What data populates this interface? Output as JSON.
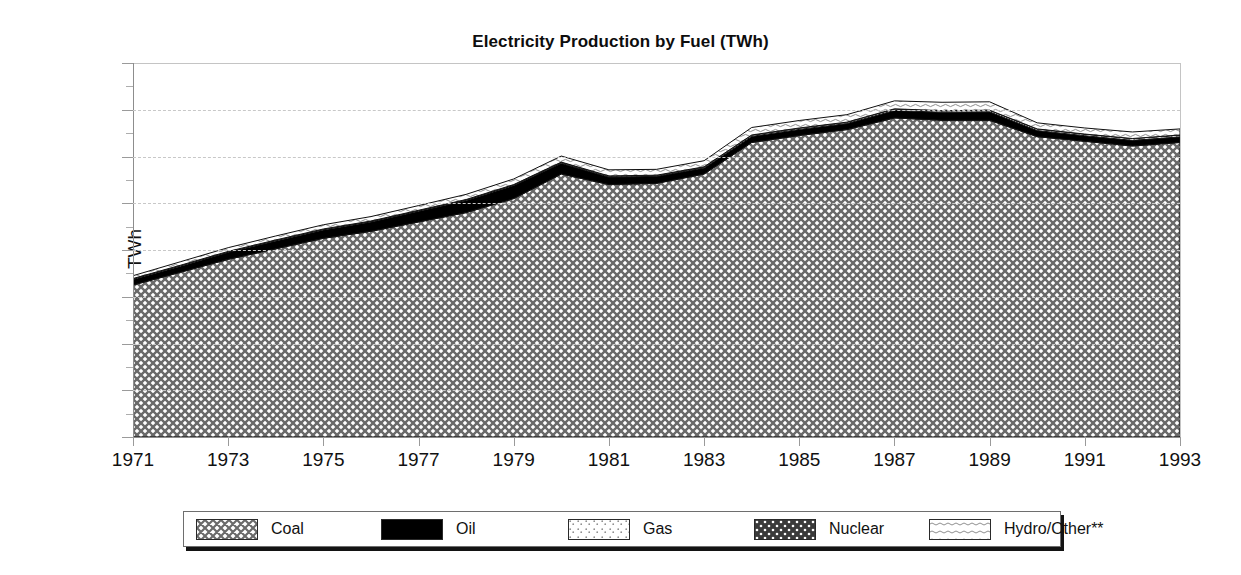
{
  "chart_data": {
    "type": "area",
    "stacked": true,
    "title": "Electricity Production by Fuel (TWh)",
    "xlabel": "",
    "ylabel": "TWh",
    "ylim": [
      0,
      160
    ],
    "xlim": [
      1971,
      1993
    ],
    "y_ticks": [
      0,
      20,
      40,
      60,
      80,
      100,
      120,
      140,
      160
    ],
    "y_minor_ticks": [
      10,
      30,
      50,
      70,
      90,
      110,
      130,
      150
    ],
    "x_ticks": [
      1971,
      1973,
      1975,
      1977,
      1979,
      1981,
      1983,
      1985,
      1987,
      1989,
      1991,
      1993
    ],
    "grid": "horizontal-dashed",
    "legend_position": "bottom",
    "x": [
      1971,
      1972,
      1973,
      1974,
      1975,
      1976,
      1977,
      1978,
      1979,
      1980,
      1981,
      1982,
      1983,
      1984,
      1985,
      1986,
      1987,
      1988,
      1989,
      1990,
      1991,
      1992,
      1993
    ],
    "series": [
      {
        "name": "Coal",
        "pattern": "diagonal-crosshatch",
        "color": "#d6d6d6",
        "values": [
          65.0,
          70.5,
          76.0,
          80.5,
          85.0,
          88.0,
          92.0,
          96.0,
          102.0,
          112.5,
          108.0,
          108.5,
          112.5,
          126.0,
          129.0,
          131.5,
          136.5,
          135.5,
          135.5,
          128.5,
          126.5,
          124.5,
          126.0
        ]
      },
      {
        "name": "Oil",
        "pattern": "solid-black",
        "color": "#000000",
        "values": [
          2.4,
          2.6,
          3.0,
          3.4,
          3.6,
          4.0,
          4.6,
          5.2,
          5.6,
          4.6,
          3.2,
          3.0,
          2.6,
          2.6,
          2.6,
          2.6,
          3.2,
          3.4,
          3.6,
          2.6,
          2.4,
          2.4,
          2.4
        ]
      },
      {
        "name": "Gas",
        "pattern": "light-dots",
        "color": "#efefef",
        "values": [
          0.4,
          0.4,
          0.4,
          0.4,
          0.4,
          0.4,
          0.4,
          0.4,
          0.4,
          0.5,
          0.5,
          0.5,
          0.5,
          0.6,
          0.6,
          0.6,
          0.7,
          0.7,
          0.7,
          0.7,
          0.7,
          0.8,
          0.8
        ]
      },
      {
        "name": "Nuclear",
        "pattern": "dense-dark-dots",
        "color": "#575757",
        "values": [
          0.0,
          0.0,
          0.0,
          0.0,
          0.0,
          0.0,
          0.0,
          0.0,
          0.0,
          0.0,
          0.0,
          0.0,
          0.0,
          0.0,
          0.0,
          0.0,
          0.0,
          0.0,
          0.0,
          0.0,
          0.0,
          0.0,
          0.0
        ]
      },
      {
        "name": "Hydro/Other**",
        "pattern": "light-waves",
        "color": "#ececec",
        "values": [
          1.2,
          1.5,
          1.6,
          1.7,
          1.8,
          1.9,
          2.0,
          2.2,
          2.4,
          2.6,
          2.6,
          2.5,
          2.6,
          3.2,
          3.2,
          3.2,
          3.4,
          3.6,
          3.6,
          2.6,
          2.6,
          2.8,
          2.6
        ]
      }
    ],
    "totals": [
      69.0,
      75.0,
      81.0,
      86.0,
      90.8,
      94.3,
      99.0,
      103.8,
      110.4,
      120.2,
      114.3,
      114.5,
      118.2,
      132.4,
      135.4,
      137.9,
      143.8,
      143.2,
      143.4,
      134.4,
      132.2,
      130.5,
      131.8
    ]
  },
  "legend": {
    "items": [
      {
        "label": "Coal"
      },
      {
        "label": "Oil"
      },
      {
        "label": "Gas"
      },
      {
        "label": "Nuclear"
      },
      {
        "label": "Hydro/Other**"
      }
    ]
  }
}
